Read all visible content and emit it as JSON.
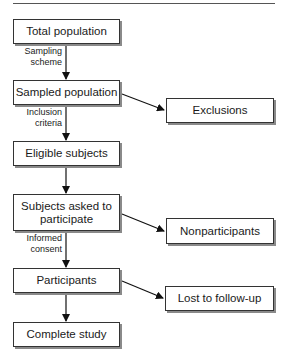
{
  "diagram": {
    "type": "flowchart",
    "main_flow": [
      {
        "id": "total",
        "label": "Total population"
      },
      {
        "id": "sampled",
        "label": "Sampled population"
      },
      {
        "id": "eligible",
        "label": "Eligible subjects"
      },
      {
        "id": "asked",
        "label": "Subjects asked to participate"
      },
      {
        "id": "participants",
        "label": "Participants"
      },
      {
        "id": "complete",
        "label": "Complete study"
      }
    ],
    "side_branches": [
      {
        "id": "exclusions",
        "label": "Exclusions",
        "from": "sampled"
      },
      {
        "id": "nonparticipants",
        "label": "Nonparticipants",
        "from": "asked"
      },
      {
        "id": "lost",
        "label": "Lost to follow-up",
        "from": "participants"
      }
    ],
    "edge_labels": {
      "sampling": [
        "Sampling",
        "scheme"
      ],
      "inclusion": [
        "Inclusion",
        "criteria"
      ],
      "consent": [
        "Informed",
        "consent"
      ]
    },
    "asked_lines": [
      "Subjects asked to",
      "participate"
    ]
  }
}
